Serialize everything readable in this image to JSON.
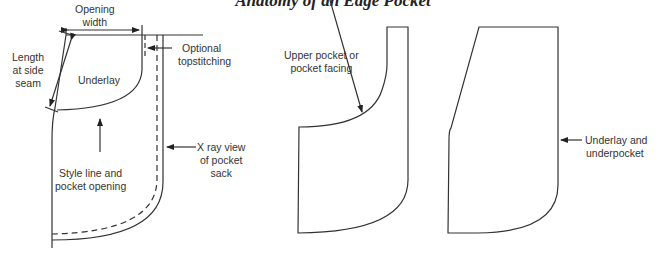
{
  "title": "Anatomy of an Edge Pocket",
  "left_diagram": {
    "labels": {
      "opening_width": [
        "Opening",
        "width"
      ],
      "length_at_side_seam": [
        "Length",
        "at side",
        "seam"
      ],
      "underlay": "Underlay",
      "optional_topstitching": [
        "Optional",
        "topstitching"
      ],
      "style_line": [
        "Style line and",
        "pocket opening"
      ],
      "xray": [
        "X ray view",
        "of pocket",
        "sack"
      ]
    }
  },
  "middle_diagram": {
    "labels": {
      "upper_pocket": [
        "Upper pocket or",
        "pocket facing"
      ]
    }
  },
  "right_diagram": {
    "labels": {
      "underlay_underpocket": [
        "Underlay and",
        "underpocket"
      ]
    }
  },
  "colors": {
    "line": "#333333",
    "text": "#333333",
    "background": "#ffffff"
  }
}
